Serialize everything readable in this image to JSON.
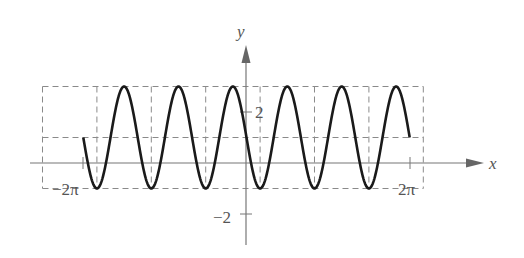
{
  "chart_data": {
    "type": "line",
    "title": "",
    "function": "y = 1 - 2 sin(3x)",
    "xlabel": "x",
    "ylabel": "y",
    "xlim": [
      -2.2,
      2.55
    ],
    "xlim_units": "multiples of pi",
    "ylim": [
      -3.2,
      4.6
    ],
    "x_tick_labels": [
      {
        "value_pi": -2,
        "label": "−2π"
      },
      {
        "value_pi": 2,
        "label": "2π"
      }
    ],
    "y_tick_labels": [
      {
        "value": 2,
        "label": "2"
      },
      {
        "value": -2,
        "label": "−2"
      }
    ],
    "domain_pi": [
      -2,
      2
    ],
    "amplitude": 2,
    "vertical_shift": 1,
    "period_pi": 0.6667,
    "series": [
      {
        "name": "y = 1 - 2sin(3x)",
        "x_pi": [
          -2,
          -1.8333,
          -1.5,
          -1.1667,
          -0.8333,
          -0.5,
          -0.1667,
          0.1667,
          0.5,
          0.8333,
          1.1667,
          1.5,
          1.8333,
          2
        ],
        "values": [
          1,
          -1,
          3,
          -1,
          3,
          -1,
          3,
          -1,
          3,
          -1,
          3,
          -1,
          3,
          1
        ],
        "note": "key points: start, troughs (y=-1), peaks (y=3), end"
      }
    ],
    "guides": {
      "dashed_horizontal_y": [
        3,
        1,
        -1
      ],
      "dashed_vertical_x_pi": [
        -2.5,
        -1.8333,
        -1.1667,
        -0.5,
        0.1667,
        0.8333,
        1.5,
        2.1667
      ],
      "style": "dashed gray rectangle bounding one period per cell"
    },
    "grid": false,
    "legend": null
  },
  "labels": {
    "x_axis": "x",
    "y_axis": "y",
    "x_tick_neg": "−2π",
    "x_tick_pos": "2π",
    "y_tick_pos": "2",
    "y_tick_neg": "−2"
  },
  "colors": {
    "curve": "#1a1a1a",
    "axis": "#777777",
    "guide": "#8a8a8a",
    "text": "#555555"
  }
}
